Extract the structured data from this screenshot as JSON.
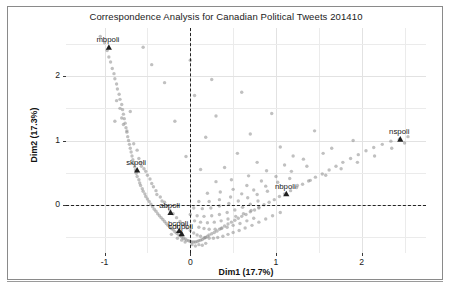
{
  "chart_data": {
    "type": "scatter",
    "title": "Correspondence Analysis for Canadian Political Tweets 201410",
    "xlabel": "Dim1 (17.7%)",
    "ylabel": "Dim2 (17.3%)",
    "xlim": [
      -1.45,
      2.75
    ],
    "ylim": [
      -0.75,
      2.75
    ],
    "xticks": [
      -1,
      0,
      1,
      2
    ],
    "xticklabels": [
      "-1",
      "0",
      "1",
      "2"
    ],
    "yticks": [
      0,
      1,
      2
    ],
    "yticklabels": [
      "0",
      "1",
      "2"
    ],
    "grid": true,
    "legend": "none",
    "reference_lines": {
      "vertical_x": 0,
      "horizontal_y": 0,
      "style": "dashed"
    },
    "labeled_points": [
      {
        "label": "mbpoli",
        "x": -0.95,
        "y": 2.45
      },
      {
        "label": "skpoli",
        "x": -0.62,
        "y": 0.54
      },
      {
        "label": "abpoli",
        "x": -0.23,
        "y": -0.12
      },
      {
        "label": "bcpoli",
        "x": -0.13,
        "y": -0.4
      },
      {
        "label": "cdnpoli",
        "x": -0.1,
        "y": -0.45
      },
      {
        "label": "nbpoli",
        "x": 1.12,
        "y": 0.17
      },
      {
        "label": "nspoli",
        "x": 2.45,
        "y": 1.02
      }
    ],
    "points": [
      [
        -1.05,
        2.62
      ],
      [
        -1.0,
        2.52
      ],
      [
        -0.97,
        2.4
      ],
      [
        -0.95,
        2.3
      ],
      [
        -0.93,
        2.22
      ],
      [
        -0.91,
        2.12
      ],
      [
        -0.89,
        2.04
      ],
      [
        -0.88,
        1.96
      ],
      [
        -0.86,
        1.88
      ],
      [
        -0.85,
        1.8
      ],
      [
        -0.83,
        1.72
      ],
      [
        -0.82,
        1.64
      ],
      [
        -0.8,
        1.56
      ],
      [
        -0.79,
        1.48
      ],
      [
        -0.78,
        1.41
      ],
      [
        -0.77,
        1.34
      ],
      [
        -0.76,
        1.27
      ],
      [
        -0.75,
        1.2
      ],
      [
        -0.74,
        1.13
      ],
      [
        -0.73,
        1.06
      ],
      [
        -0.72,
        1.0
      ],
      [
        -0.71,
        0.94
      ],
      [
        -0.7,
        0.88
      ],
      [
        -0.69,
        0.82
      ],
      [
        -0.68,
        0.76
      ],
      [
        -0.67,
        0.7
      ],
      [
        -0.66,
        0.64
      ],
      [
        -0.65,
        0.59
      ],
      [
        -0.64,
        0.54
      ],
      [
        -0.63,
        0.49
      ],
      [
        -0.62,
        0.44
      ],
      [
        -0.6,
        0.39
      ],
      [
        -0.59,
        0.34
      ],
      [
        -0.58,
        0.3
      ],
      [
        -0.56,
        0.25
      ],
      [
        -0.55,
        0.21
      ],
      [
        -0.53,
        0.17
      ],
      [
        -0.52,
        0.13
      ],
      [
        -0.5,
        0.09
      ],
      [
        -0.48,
        0.05
      ],
      [
        -0.46,
        0.01
      ],
      [
        -0.44,
        -0.03
      ],
      [
        -0.42,
        -0.07
      ],
      [
        -0.4,
        -0.1
      ],
      [
        -0.38,
        -0.14
      ],
      [
        -0.36,
        -0.17
      ],
      [
        -0.34,
        -0.2
      ],
      [
        -0.32,
        -0.23
      ],
      [
        -0.3,
        -0.26
      ],
      [
        -0.28,
        -0.29
      ],
      [
        -0.26,
        -0.32
      ],
      [
        -0.24,
        -0.34
      ],
      [
        -0.22,
        -0.37
      ],
      [
        -0.2,
        -0.39
      ],
      [
        -0.18,
        -0.42
      ],
      [
        -0.16,
        -0.44
      ],
      [
        -0.14,
        -0.46
      ],
      [
        -0.12,
        -0.48
      ],
      [
        -0.1,
        -0.5
      ],
      [
        -0.08,
        -0.52
      ],
      [
        -0.06,
        -0.53
      ],
      [
        -0.04,
        -0.55
      ],
      [
        -0.02,
        -0.56
      ],
      [
        0.0,
        -0.57
      ],
      [
        0.02,
        -0.58
      ],
      [
        0.04,
        -0.58
      ],
      [
        0.06,
        -0.58
      ],
      [
        0.08,
        -0.57
      ],
      [
        0.1,
        -0.56
      ],
      [
        0.12,
        -0.55
      ],
      [
        0.14,
        -0.54
      ],
      [
        0.16,
        -0.52
      ],
      [
        0.18,
        -0.51
      ],
      [
        0.2,
        -0.49
      ],
      [
        0.22,
        -0.47
      ],
      [
        0.25,
        -0.45
      ],
      [
        0.28,
        -0.43
      ],
      [
        0.31,
        -0.41
      ],
      [
        0.34,
        -0.38
      ],
      [
        0.37,
        -0.36
      ],
      [
        0.4,
        -0.33
      ],
      [
        0.44,
        -0.3
      ],
      [
        0.48,
        -0.27
      ],
      [
        0.52,
        -0.24
      ],
      [
        0.56,
        -0.21
      ],
      [
        0.6,
        -0.18
      ],
      [
        0.65,
        -0.15
      ],
      [
        0.7,
        -0.11
      ],
      [
        0.75,
        -0.08
      ],
      [
        0.8,
        -0.04
      ],
      [
        0.86,
        0.0
      ],
      [
        0.92,
        0.04
      ],
      [
        0.98,
        0.08
      ],
      [
        1.04,
        0.13
      ],
      [
        1.1,
        0.17
      ],
      [
        1.17,
        0.22
      ],
      [
        1.24,
        0.27
      ],
      [
        1.31,
        0.32
      ],
      [
        1.38,
        0.37
      ],
      [
        1.46,
        0.43
      ],
      [
        1.54,
        0.48
      ],
      [
        1.62,
        0.54
      ],
      [
        1.7,
        0.6
      ],
      [
        1.78,
        0.66
      ],
      [
        1.87,
        0.72
      ],
      [
        1.96,
        0.78
      ],
      [
        2.05,
        0.84
      ],
      [
        2.14,
        0.89
      ],
      [
        2.24,
        0.94
      ],
      [
        2.34,
        0.99
      ],
      [
        2.44,
        1.02
      ],
      [
        2.54,
        1.06
      ],
      [
        -0.8,
        1.35
      ],
      [
        -0.7,
        1.45
      ],
      [
        -0.88,
        1.3
      ],
      [
        -0.6,
        0.72
      ],
      [
        -0.57,
        0.6
      ],
      [
        -0.5,
        0.46
      ],
      [
        -0.45,
        0.33
      ],
      [
        -0.4,
        0.22
      ],
      [
        -0.35,
        0.12
      ],
      [
        -0.3,
        0.04
      ],
      [
        -0.52,
        0.52
      ],
      [
        -0.47,
        0.4
      ],
      [
        -0.43,
        0.28
      ],
      [
        -0.39,
        0.16
      ],
      [
        -0.33,
        0.06
      ],
      [
        -0.28,
        -0.02
      ],
      [
        -0.24,
        -0.08
      ],
      [
        -0.2,
        -0.14
      ],
      [
        -0.16,
        -0.2
      ],
      [
        -0.12,
        -0.26
      ],
      [
        -0.08,
        -0.31
      ],
      [
        -0.04,
        -0.36
      ],
      [
        0.0,
        -0.4
      ],
      [
        0.04,
        -0.44
      ],
      [
        0.08,
        -0.47
      ],
      [
        0.12,
        -0.49
      ],
      [
        0.17,
        -0.51
      ],
      [
        0.22,
        -0.52
      ],
      [
        0.27,
        -0.52
      ],
      [
        0.32,
        -0.51
      ],
      [
        0.38,
        -0.49
      ],
      [
        0.44,
        -0.46
      ],
      [
        0.5,
        -0.43
      ],
      [
        0.57,
        -0.4
      ],
      [
        0.64,
        -0.36
      ],
      [
        0.72,
        -0.32
      ],
      [
        0.8,
        -0.27
      ],
      [
        0.88,
        -0.22
      ],
      [
        0.96,
        -0.17
      ],
      [
        1.05,
        -0.12
      ],
      [
        0.1,
        -0.35
      ],
      [
        0.16,
        -0.37
      ],
      [
        0.22,
        -0.38
      ],
      [
        0.29,
        -0.38
      ],
      [
        0.36,
        -0.37
      ],
      [
        0.43,
        -0.35
      ],
      [
        0.5,
        -0.32
      ],
      [
        0.58,
        -0.29
      ],
      [
        0.66,
        -0.25
      ],
      [
        0.74,
        -0.21
      ],
      [
        0.05,
        -0.25
      ],
      [
        0.12,
        -0.27
      ],
      [
        0.2,
        -0.28
      ],
      [
        0.28,
        -0.27
      ],
      [
        0.36,
        -0.25
      ],
      [
        0.44,
        -0.22
      ],
      [
        0.53,
        -0.18
      ],
      [
        0.62,
        -0.14
      ],
      [
        0.71,
        -0.09
      ],
      [
        0.8,
        -0.05
      ],
      [
        0.0,
        -0.15
      ],
      [
        0.08,
        -0.17
      ],
      [
        0.16,
        -0.18
      ],
      [
        0.25,
        -0.17
      ],
      [
        0.34,
        -0.15
      ],
      [
        0.43,
        -0.12
      ],
      [
        0.52,
        -0.08
      ],
      [
        0.61,
        -0.04
      ],
      [
        0.7,
        0.01
      ],
      [
        0.79,
        0.06
      ],
      [
        0.04,
        -0.05
      ],
      [
        0.14,
        -0.06
      ],
      [
        0.24,
        -0.05
      ],
      [
        0.34,
        -0.02
      ],
      [
        0.45,
        0.02
      ],
      [
        0.56,
        0.06
      ],
      [
        0.67,
        0.11
      ],
      [
        0.78,
        0.16
      ],
      [
        0.9,
        0.21
      ],
      [
        0.1,
        0.05
      ],
      [
        0.22,
        0.05
      ],
      [
        0.34,
        0.08
      ],
      [
        0.47,
        0.12
      ],
      [
        0.6,
        0.17
      ],
      [
        0.74,
        0.23
      ],
      [
        0.88,
        0.29
      ],
      [
        1.02,
        0.35
      ],
      [
        1.16,
        0.41
      ],
      [
        0.2,
        0.18
      ],
      [
        0.35,
        0.2
      ],
      [
        0.5,
        0.24
      ],
      [
        0.66,
        0.3
      ],
      [
        0.83,
        0.37
      ],
      [
        1.0,
        0.44
      ],
      [
        1.18,
        0.52
      ],
      [
        1.36,
        0.6
      ],
      [
        0.3,
        0.36
      ],
      [
        0.48,
        0.39
      ],
      [
        0.68,
        0.45
      ],
      [
        0.89,
        0.53
      ],
      [
        1.1,
        0.62
      ],
      [
        1.32,
        0.71
      ],
      [
        1.55,
        0.8
      ],
      [
        0.12,
        0.55
      ],
      [
        0.4,
        0.58
      ],
      [
        0.78,
        0.66
      ],
      [
        1.2,
        0.76
      ],
      [
        1.65,
        0.88
      ],
      [
        -0.05,
        0.75
      ],
      [
        0.55,
        0.8
      ],
      [
        1.05,
        0.9
      ],
      [
        1.9,
        1.0
      ],
      [
        0.18,
        1.05
      ],
      [
        0.7,
        1.1
      ],
      [
        1.45,
        1.15
      ],
      [
        -0.18,
        1.3
      ],
      [
        0.3,
        1.38
      ],
      [
        0.95,
        1.42
      ],
      [
        0.05,
        1.7
      ],
      [
        0.6,
        1.75
      ],
      [
        -0.3,
        1.9
      ],
      [
        0.25,
        1.95
      ],
      [
        -0.45,
        2.18
      ],
      [
        0.0,
        2.25
      ],
      [
        -0.55,
        2.45
      ],
      [
        -0.66,
        0.95
      ],
      [
        -0.62,
        0.85
      ],
      [
        -0.58,
        0.66
      ],
      [
        -0.54,
        0.56
      ],
      [
        -0.86,
        1.62
      ],
      [
        -0.82,
        1.5
      ],
      [
        -0.78,
        1.25
      ],
      [
        -0.74,
        1.15
      ],
      [
        1.25,
        0.3
      ],
      [
        1.4,
        0.38
      ],
      [
        1.58,
        0.46
      ],
      [
        1.76,
        0.56
      ],
      [
        1.95,
        0.66
      ],
      [
        2.15,
        0.76
      ],
      [
        2.35,
        0.88
      ],
      [
        2.5,
        0.96
      ],
      [
        -0.15,
        -0.52
      ],
      [
        -0.06,
        -0.58
      ],
      [
        0.02,
        -0.62
      ],
      [
        0.1,
        -0.62
      ],
      [
        0.18,
        -0.6
      ],
      [
        -0.22,
        -0.46
      ],
      [
        -0.1,
        -0.55
      ],
      [
        0.06,
        -0.64
      ],
      [
        0.14,
        -0.63
      ]
    ]
  }
}
